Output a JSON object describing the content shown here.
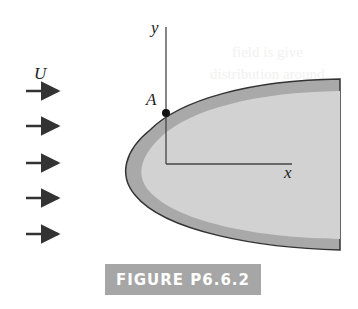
{
  "figure": {
    "labels": {
      "flow": "U",
      "y_axis": "y",
      "x_axis": "x",
      "point": "A"
    },
    "caption": "FIGURE P6.6.2",
    "arrow_count": 5,
    "colors": {
      "body_outer": "#a9a9a9",
      "body_inner": "#d2d2d2",
      "outline": "#333333",
      "caption_bg": "#a6a6a6"
    }
  },
  "background_bleed": [
    "field is give",
    "distribution around"
  ]
}
